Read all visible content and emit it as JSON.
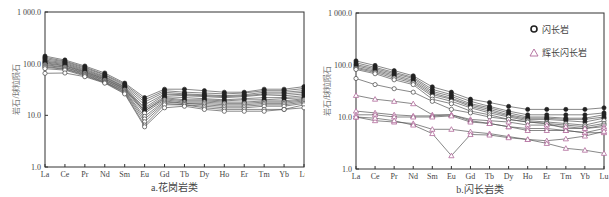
{
  "chart_data": [
    {
      "type": "line",
      "title": "",
      "caption": "a.花岗岩类",
      "xlabel": "",
      "ylabel": "岩石/球粒陨石",
      "yscale": "log",
      "ylim": [
        1.0,
        1000.0
      ],
      "yticks": [
        "1.0",
        "10.0",
        "100.0",
        "1 000.0"
      ],
      "grid": false,
      "legend": null,
      "categories": [
        "La",
        "Ce",
        "Pr",
        "Nd",
        "Sm",
        "Eu",
        "Gd",
        "Tb",
        "Dy",
        "Ho",
        "Er",
        "Tm",
        "Yb",
        "Lu"
      ],
      "series": [
        {
          "name": "g1",
          "marker": "filled-circle",
          "values": [
            140,
            118,
            90,
            66,
            42,
            22,
            32,
            32,
            30,
            28,
            28,
            32,
            32,
            36
          ]
        },
        {
          "name": "g2",
          "marker": "filled-circle",
          "values": [
            132,
            112,
            86,
            62,
            40,
            20,
            30,
            28,
            27,
            26,
            27,
            30,
            30,
            33
          ]
        },
        {
          "name": "g3",
          "marker": "filled-circle",
          "values": [
            125,
            108,
            82,
            60,
            38,
            18,
            28,
            26,
            25,
            24,
            25,
            28,
            28,
            30
          ]
        },
        {
          "name": "g4",
          "marker": "filled-circle",
          "values": [
            118,
            104,
            78,
            57,
            36,
            16,
            26,
            25,
            24,
            23,
            24,
            26,
            26,
            28
          ]
        },
        {
          "name": "g5",
          "marker": "filled-circle",
          "values": [
            112,
            100,
            75,
            55,
            35,
            14,
            25,
            24,
            23,
            22,
            23,
            25,
            24,
            26
          ]
        },
        {
          "name": "g6",
          "marker": "filled-circle",
          "values": [
            108,
            96,
            72,
            53,
            34,
            13,
            23,
            22,
            21,
            20,
            21,
            22,
            22,
            24
          ]
        },
        {
          "name": "g7",
          "marker": "filled-circle",
          "values": [
            104,
            92,
            70,
            51,
            33,
            12,
            22,
            20,
            20,
            19,
            20,
            20,
            21,
            22
          ]
        },
        {
          "name": "g8",
          "marker": "filled-circle",
          "values": [
            100,
            90,
            68,
            50,
            32,
            12,
            21,
            19,
            19,
            18,
            18,
            19,
            19,
            21
          ]
        },
        {
          "name": "g9",
          "marker": "open-circle",
          "values": [
            96,
            86,
            66,
            48,
            31,
            11,
            20,
            18,
            18,
            17,
            17,
            18,
            18,
            20
          ]
        },
        {
          "name": "g10",
          "marker": "open-circle",
          "values": [
            92,
            84,
            64,
            47,
            30,
            9.5,
            19,
            17,
            17,
            16,
            16,
            17,
            17,
            19
          ]
        },
        {
          "name": "g11",
          "marker": "open-circle",
          "values": [
            88,
            80,
            62,
            45,
            29,
            8.5,
            18,
            17,
            16,
            15,
            15,
            16,
            16,
            18
          ]
        },
        {
          "name": "g12",
          "marker": "open-circle",
          "values": [
            85,
            78,
            60,
            44,
            28,
            7.5,
            17,
            16,
            15,
            14,
            14,
            15,
            15,
            17
          ]
        },
        {
          "name": "g13",
          "marker": "open-circle",
          "values": [
            80,
            75,
            58,
            43,
            27,
            6.5,
            16,
            16,
            14,
            13,
            13,
            13,
            13,
            16
          ]
        },
        {
          "name": "g14",
          "marker": "open-circle",
          "values": [
            65,
            66,
            56,
            42,
            26,
            6.0,
            14,
            15,
            13,
            12,
            12,
            12,
            13,
            14
          ]
        }
      ]
    },
    {
      "type": "line",
      "title": "",
      "caption": "b.闪长岩类",
      "xlabel": "",
      "ylabel": "岩石/球粒陨石",
      "yscale": "log",
      "ylim": [
        1.0,
        1000.0
      ],
      "yticks": [
        "1.0",
        "10.0",
        "100.0",
        "1 000.0"
      ],
      "grid": false,
      "legend": {
        "position": "top-right",
        "entries": [
          "闪长岩",
          "辉长闪长岩"
        ]
      },
      "categories": [
        "La",
        "Ce",
        "Pr",
        "Nd",
        "Sm",
        "Eu",
        "Gd",
        "Tb",
        "Dy",
        "Ho",
        "Er",
        "Tm",
        "Yb",
        "Lu"
      ],
      "series": [
        {
          "name": "闪长岩-1",
          "group": "闪长岩",
          "marker": "filled-circle",
          "values": [
            120,
            98,
            78,
            62,
            38,
            30,
            22,
            19,
            16,
            14,
            14,
            14,
            14,
            15
          ]
        },
        {
          "name": "闪长岩-2",
          "group": "闪长岩",
          "marker": "filled-circle",
          "values": [
            110,
            90,
            72,
            58,
            34,
            27,
            20,
            16,
            13,
            11,
            11,
            11,
            11,
            12
          ]
        },
        {
          "name": "闪长岩-3",
          "group": "闪长岩",
          "marker": "filled-circle",
          "values": [
            102,
            85,
            68,
            55,
            31,
            25,
            18,
            15,
            12,
            10,
            10,
            9.5,
            9.5,
            11
          ]
        },
        {
          "name": "闪长岩-4",
          "group": "闪长岩",
          "marker": "filled-circle",
          "values": [
            96,
            80,
            64,
            51,
            29,
            23,
            17,
            14,
            11,
            9.5,
            9.5,
            9,
            9,
            10
          ]
        },
        {
          "name": "闪长岩-5",
          "group": "闪长岩",
          "marker": "filled-circle",
          "values": [
            90,
            76,
            60,
            48,
            27,
            22,
            16,
            13,
            10.5,
            9,
            9,
            8.5,
            8,
            9.5
          ]
        },
        {
          "name": "闪长岩-6",
          "group": "闪长岩",
          "marker": "open-circle",
          "values": [
            86,
            72,
            56,
            45,
            25,
            20,
            15,
            12,
            10,
            8.5,
            8,
            7.5,
            7,
            8.5
          ]
        },
        {
          "name": "闪长岩-7",
          "group": "闪长岩",
          "marker": "open-circle",
          "values": [
            82,
            68,
            52,
            42,
            22,
            18,
            13,
            11,
            9,
            8,
            7.5,
            7,
            6.5,
            7.5
          ]
        },
        {
          "name": "闪长岩-8",
          "group": "闪长岩",
          "marker": "open-circle",
          "values": [
            55,
            42,
            35,
            30,
            20,
            14,
            12,
            10,
            9,
            8,
            7.5,
            6,
            6,
            7
          ]
        },
        {
          "name": "辉长闪长岩-1",
          "group": "辉长闪长岩",
          "marker": "open-triangle",
          "values": [
            26,
            22,
            20,
            18,
            11,
            11,
            9,
            8.5,
            8,
            7,
            7,
            6.5,
            6,
            6.5
          ]
        },
        {
          "name": "辉长闪长岩-2",
          "group": "辉长闪长岩",
          "marker": "open-triangle",
          "values": [
            13,
            12,
            11,
            10.5,
            10.5,
            11,
            8.5,
            7.5,
            6.5,
            6,
            6,
            5.5,
            5,
            6
          ]
        },
        {
          "name": "辉长闪长岩-3",
          "group": "辉长闪长岩",
          "marker": "open-triangle",
          "values": [
            11,
            11,
            10,
            10,
            10,
            10.5,
            8,
            7.5,
            6.5,
            5.5,
            5.5,
            5.5,
            5,
            5
          ]
        },
        {
          "name": "辉长闪长岩-4",
          "group": "辉长闪长岩",
          "marker": "open-triangle",
          "values": [
            10,
            8.5,
            8,
            7.5,
            5.8,
            5.8,
            5.2,
            4.8,
            4.2,
            3.7,
            3.5,
            3.8,
            4.3,
            5.3
          ]
        },
        {
          "name": "辉长闪长岩-5",
          "group": "辉长闪长岩",
          "marker": "open-triangle",
          "values": [
            10,
            9.5,
            8.5,
            7,
            4.8,
            1.8,
            4.6,
            4.5,
            4.0,
            3.7,
            3.1,
            2.5,
            2.3,
            2.0
          ]
        }
      ]
    }
  ],
  "colors": {
    "axis": "#333333",
    "line": "#555555",
    "circle": "#333333",
    "triangle": "#b06a9a",
    "text": "#444444"
  }
}
